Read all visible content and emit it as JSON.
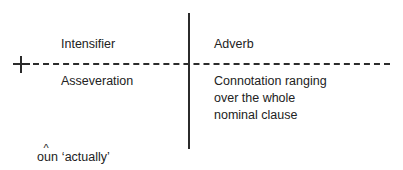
{
  "diagram": {
    "type": "semantic-feature-cross-classification",
    "axes": {
      "vertical_style": "solid",
      "horizontal_style": "dashed",
      "line_color": "#2b2b2b"
    },
    "markers": {
      "positive_symbol": "+"
    },
    "quadrants": {
      "upper_left": "Intensifier",
      "upper_right": "Adverb",
      "lower_left": "Asseveration",
      "lower_right_lines": [
        "Connotation ranging",
        "over the whole",
        "nominal clause"
      ]
    },
    "gloss": {
      "headword_base": "oun",
      "headword_before_diacritic": "o",
      "headword_after_diacritic": "un",
      "diacritic": "^",
      "translation": "‘actually’"
    },
    "text_color": "#222222",
    "background_color": "#ffffff"
  }
}
